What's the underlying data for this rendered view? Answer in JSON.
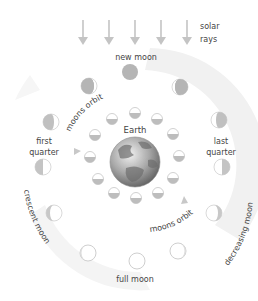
{
  "labels": {
    "solar_rays_line1": "solar",
    "solar_rays_line2": "rays",
    "new_moon": "new moon",
    "first_quarter_line1": "first",
    "first_quarter_line2": "quarter",
    "last_quarter_line1": "last",
    "last_quarter_line2": "quarter",
    "crescent_moon": "crescent moon",
    "decreasing_moon": "decreasing moon",
    "full_moon": "full moon",
    "earth": "Earth",
    "moons_orbit_top": "moons orbit",
    "moons_orbit_bottom": "moons orbit"
  },
  "colors": {
    "moon_shadow": "#b9b9b9",
    "moon_lit": "#ffffff",
    "moon_outline": "#c8c8c8",
    "arrow": "#c4c4c4",
    "band": "#efefef",
    "earth_light": "#d9d9d9",
    "earth_dark": "#7a7a7a",
    "text": "#444444"
  },
  "solar_rays": {
    "count": 5
  },
  "outer_moons": [
    {
      "phase": "new moon"
    },
    {
      "phase": "waxing crescent (upper left)"
    },
    {
      "phase": "waning crescent (upper right)"
    },
    {
      "phase": "first quarter (upper)"
    },
    {
      "phase": "last quarter (upper)"
    },
    {
      "phase": "first quarter (lower)"
    },
    {
      "phase": "last quarter (lower)"
    },
    {
      "phase": "crescent moon"
    },
    {
      "phase": "decreasing moon"
    },
    {
      "phase": "waxing gibbous"
    },
    {
      "phase": "full moon"
    },
    {
      "phase": "waning gibbous"
    }
  ],
  "inner_moons": {
    "count": 12
  }
}
